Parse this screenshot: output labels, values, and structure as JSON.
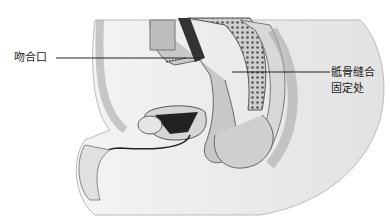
{
  "figure": {
    "type": "anatomical-illustration",
    "style": "grayscale",
    "labels": [
      {
        "id": "anastomosis",
        "text": "吻合口",
        "x": 14,
        "y": 51,
        "line_from": [
          56,
          58
        ],
        "line_to": [
          200,
          58
        ]
      },
      {
        "id": "sacral-suture-fixation",
        "lines": [
          "骶骨缝合",
          "固定处"
        ],
        "x": 331,
        "y": 66,
        "line_from": [
          232,
          72
        ],
        "line_to": [
          330,
          72
        ]
      }
    ]
  }
}
